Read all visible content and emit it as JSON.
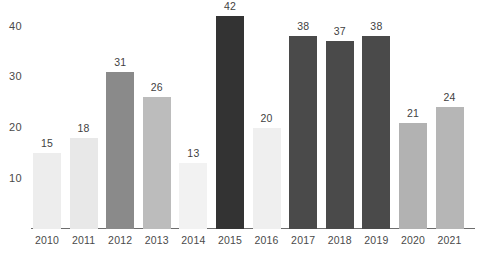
{
  "chart_data": {
    "type": "bar",
    "title": "",
    "subtitle": "",
    "xlabel": "",
    "ylabel": "",
    "categories": [
      "2010",
      "2011",
      "2012",
      "2013",
      "2014",
      "2015",
      "2016",
      "2017",
      "2018",
      "2019",
      "2020",
      "2021"
    ],
    "values": [
      15,
      18,
      31,
      26,
      13,
      42,
      20,
      38,
      37,
      38,
      21,
      24
    ],
    "value_labels": [
      "15",
      "18",
      "31",
      "26",
      "13",
      "42",
      "20",
      "38",
      "37",
      "38",
      "21",
      "24"
    ],
    "bar_colors": [
      "#ededed",
      "#e8e8e8",
      "#8a8a8a",
      "#bcbcbc",
      "#f2f2f2",
      "#333333",
      "#efefef",
      "#4a4a4a",
      "#4a4a4a",
      "#4a4a4a",
      "#b2b2b2",
      "#b6b6b6"
    ],
    "ylim": [
      0,
      44
    ],
    "yticks": [
      10,
      20,
      30,
      40
    ],
    "ytick_labels": [
      "10",
      "20",
      "30",
      "40"
    ],
    "grid": false,
    "legend": null,
    "axis_line_color": "#6d6d6d",
    "label_color": "#4a4a4a"
  }
}
